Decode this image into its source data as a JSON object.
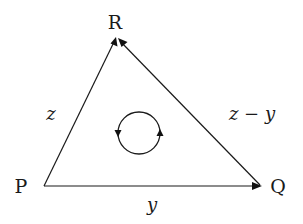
{
  "diagram": {
    "type": "directed-triangle",
    "vertices": [
      {
        "id": "P",
        "label": "P"
      },
      {
        "id": "Q",
        "label": "Q"
      },
      {
        "id": "R",
        "label": "R"
      }
    ],
    "edges": [
      {
        "from": "P",
        "to": "R",
        "label": "z"
      },
      {
        "from": "Q",
        "to": "R",
        "label": "z − y"
      },
      {
        "from": "P",
        "to": "Q",
        "label": "y"
      }
    ],
    "circulation": {
      "direction": "counter-clockwise"
    },
    "colors": {
      "stroke": "#1a1a1a",
      "background": "#ffffff"
    }
  }
}
